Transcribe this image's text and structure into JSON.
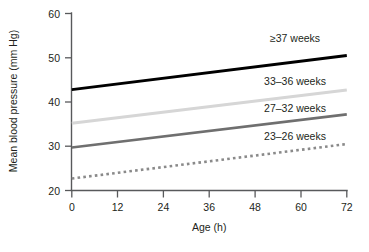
{
  "chart_data": {
    "type": "line",
    "title": "",
    "xlabel": "Age (h)",
    "ylabel": "Mean blood pressure (mm Hg)",
    "xlim": [
      0,
      72
    ],
    "ylim": [
      20,
      60
    ],
    "xticks": [
      0,
      12,
      24,
      36,
      48,
      60,
      72
    ],
    "yticks": [
      20,
      30,
      40,
      50,
      60
    ],
    "xtick_labels": [
      "0",
      "12",
      "24",
      "36",
      "48",
      "60",
      "72"
    ],
    "ytick_labels": [
      "20",
      "30",
      "40",
      "50",
      "60"
    ],
    "grid": false,
    "legend_position": "inline-end-of-line",
    "x": [
      0,
      72
    ],
    "series": [
      {
        "name": "≥37 weeks",
        "label": "≥37 weeks",
        "values": [
          42.8,
          50.5
        ],
        "color": "#000000",
        "style": "solid",
        "width": 2.9,
        "label_x": 36,
        "label_y": 228
      },
      {
        "name": "33–36 weeks",
        "label": "33–36 weeks",
        "values": [
          35.2,
          42.7
        ],
        "color": "#d6d6d6",
        "style": "solid",
        "width": 2.9,
        "label_x": 36,
        "label_y": 228
      },
      {
        "name": "27–32 weeks",
        "label": "27–32 weeks",
        "values": [
          29.7,
          37.2
        ],
        "color": "#6f6f6f",
        "style": "solid",
        "width": 2.6,
        "label_x": 36,
        "label_y": 228
      },
      {
        "name": "23–26 weeks",
        "label": "23–26 weeks",
        "values": [
          22.7,
          30.5
        ],
        "color": "#8a8a8a",
        "style": "dotted",
        "width": 2.6,
        "label_x": 36,
        "label_y": 228
      }
    ]
  },
  "labels": {
    "series_0": "≥37 weeks",
    "series_1": "33–36 weeks",
    "series_2": "27–32 weeks",
    "series_3": "23–26 weeks",
    "y_axis_title": "Mean blood pressure (mm Hg)",
    "x_axis_title": "Age (h)",
    "y_0": "60",
    "y_1": "50",
    "y_2": "40",
    "y_3": "30",
    "y_4": "20",
    "x_0": "0",
    "x_1": "12",
    "x_2": "24",
    "x_3": "36",
    "x_4": "48",
    "x_5": "60",
    "x_6": "72"
  }
}
